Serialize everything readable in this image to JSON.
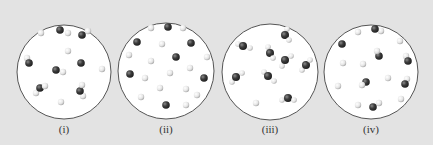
{
  "figure": {
    "background_color": "#e3e3e3",
    "circle_fill": "#ffffff",
    "circle_stroke": "#555555",
    "dark_atom_color": "#3d3d3d",
    "light_atom_color": "#e8e8e8",
    "panels": [
      {
        "label": "(i)",
        "center": [
          64,
          72
        ],
        "radius": 47,
        "particles": [
          {
            "type": "light",
            "x": 41,
            "y": 33
          },
          {
            "type": "molecule-dark-light",
            "x": 60,
            "y": 30,
            "lx": 68,
            "ly": 33
          },
          {
            "type": "molecule-dark-light",
            "x": 82,
            "y": 35,
            "lx": 88,
            "ly": 31
          },
          {
            "type": "light",
            "x": 68,
            "y": 51
          },
          {
            "type": "molecule-dark-light",
            "x": 29,
            "y": 63,
            "lx": 27,
            "ly": 58
          },
          {
            "type": "molecule-dark-light",
            "x": 56,
            "y": 70,
            "lx": 63,
            "ly": 72
          },
          {
            "type": "dark",
            "x": 81,
            "y": 63
          },
          {
            "type": "light",
            "x": 102,
            "y": 69
          },
          {
            "type": "molecule-light-dark-light",
            "x": 40,
            "y": 88,
            "lx": 36,
            "ly": 93,
            "l2x": 45,
            "l2y": 86
          },
          {
            "type": "molecule-light-dark-light",
            "x": 80,
            "y": 91,
            "lx": 83,
            "ly": 96,
            "l2x": 82,
            "l2y": 85
          },
          {
            "type": "light",
            "x": 61,
            "y": 102
          }
        ]
      },
      {
        "label": "(ii)",
        "center": [
          166,
          71
        ],
        "radius": 48,
        "particles": [
          {
            "type": "light",
            "x": 151,
            "y": 28
          },
          {
            "type": "dark",
            "x": 168,
            "y": 27
          },
          {
            "type": "light",
            "x": 183,
            "y": 28
          },
          {
            "type": "dark",
            "x": 137,
            "y": 42
          },
          {
            "type": "light",
            "x": 162,
            "y": 44
          },
          {
            "type": "dark",
            "x": 191,
            "y": 43
          },
          {
            "type": "light",
            "x": 129,
            "y": 55
          },
          {
            "type": "dark",
            "x": 176,
            "y": 57
          },
          {
            "type": "light",
            "x": 151,
            "y": 61
          },
          {
            "type": "light",
            "x": 207,
            "y": 57
          },
          {
            "type": "light",
            "x": 190,
            "y": 68
          },
          {
            "type": "dark",
            "x": 130,
            "y": 74
          },
          {
            "type": "light",
            "x": 145,
            "y": 78
          },
          {
            "type": "light",
            "x": 170,
            "y": 73
          },
          {
            "type": "dark",
            "x": 204,
            "y": 78
          },
          {
            "type": "light",
            "x": 160,
            "y": 88
          },
          {
            "type": "light",
            "x": 186,
            "y": 89
          },
          {
            "type": "light",
            "x": 197,
            "y": 95
          },
          {
            "type": "light",
            "x": 141,
            "y": 97
          },
          {
            "type": "dark",
            "x": 166,
            "y": 105
          },
          {
            "type": "light",
            "x": 186,
            "y": 105
          }
        ]
      },
      {
        "label": "(iii)",
        "center": [
          270,
          72
        ],
        "radius": 48,
        "particles": [
          {
            "type": "water",
            "x": 285,
            "y": 35,
            "h1x": 287,
            "h1y": 29,
            "h2x": 289,
            "h2y": 40
          },
          {
            "type": "water",
            "x": 243,
            "y": 46,
            "h1x": 238,
            "h1y": 44,
            "h2x": 250,
            "h2y": 48
          },
          {
            "type": "water",
            "x": 270,
            "y": 53,
            "h1x": 268,
            "h1y": 47,
            "h2x": 273,
            "h2y": 58
          },
          {
            "type": "water",
            "x": 285,
            "y": 60,
            "h1x": 282,
            "h1y": 66,
            "h2x": 291,
            "h2y": 56
          },
          {
            "type": "water",
            "x": 306,
            "y": 65,
            "h1x": 302,
            "h1y": 70,
            "h2x": 310,
            "h2y": 60
          },
          {
            "type": "water",
            "x": 236,
            "y": 77,
            "h1x": 232,
            "h1y": 82,
            "h2x": 242,
            "h2y": 73
          },
          {
            "type": "water",
            "x": 268,
            "y": 76,
            "h1x": 264,
            "h1y": 72,
            "h2x": 274,
            "h2y": 81
          },
          {
            "type": "light",
            "x": 256,
            "y": 103
          },
          {
            "type": "water",
            "x": 288,
            "y": 98,
            "h1x": 282,
            "h1y": 100,
            "h2x": 294,
            "h2y": 100
          }
        ]
      },
      {
        "label": "(iv)",
        "center": [
          371,
          72
        ],
        "radius": 47,
        "particles": [
          {
            "type": "light",
            "x": 358,
            "y": 32
          },
          {
            "type": "molecule-dark-light",
            "x": 375,
            "y": 29,
            "lx": 381,
            "ly": 31
          },
          {
            "type": "dark",
            "x": 342,
            "y": 44
          },
          {
            "type": "light",
            "x": 400,
            "y": 41
          },
          {
            "type": "molecule-light-dark",
            "x": 379,
            "y": 56,
            "lx": 377,
            "ly": 51
          },
          {
            "type": "molecule-dark-light",
            "x": 408,
            "y": 61,
            "lx": 406,
            "ly": 56
          },
          {
            "type": "light",
            "x": 343,
            "y": 63
          },
          {
            "type": "light",
            "x": 363,
            "y": 64
          },
          {
            "type": "light",
            "x": 388,
            "y": 78
          },
          {
            "type": "molecule-light-dark",
            "x": 366,
            "y": 82,
            "lx": 362,
            "ly": 85
          },
          {
            "type": "molecule-dark-light",
            "x": 405,
            "y": 84,
            "lx": 407,
            "ly": 79
          },
          {
            "type": "light",
            "x": 338,
            "y": 86
          },
          {
            "type": "light",
            "x": 401,
            "y": 99
          },
          {
            "type": "light",
            "x": 358,
            "y": 105
          },
          {
            "type": "molecule-dark-light",
            "x": 373,
            "y": 107,
            "lx": 379,
            "ly": 103
          }
        ]
      }
    ]
  }
}
